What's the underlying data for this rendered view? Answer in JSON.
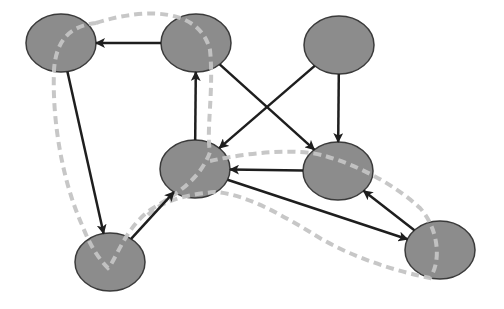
{
  "diagram": {
    "type": "directed-graph",
    "width": 504,
    "height": 309,
    "colors": {
      "background": "#ffffff",
      "node_fill": "#8c8c8c",
      "node_stroke": "#3a3a3a",
      "edge": "#1e1e1e",
      "cycle_highlight": "#c4c4c4"
    },
    "node_radius": {
      "rx": 35,
      "ry": 29
    },
    "nodes": [
      {
        "id": "n1",
        "cx": 61,
        "cy": 43
      },
      {
        "id": "n2",
        "cx": 196,
        "cy": 43
      },
      {
        "id": "n3",
        "cx": 339,
        "cy": 45
      },
      {
        "id": "n4",
        "cx": 195,
        "cy": 169
      },
      {
        "id": "n5",
        "cx": 338,
        "cy": 171
      },
      {
        "id": "n6",
        "cx": 110,
        "cy": 262
      },
      {
        "id": "n7",
        "cx": 440,
        "cy": 250
      }
    ],
    "edges": [
      {
        "from": "n2",
        "to": "n1"
      },
      {
        "from": "n1",
        "to": "n6"
      },
      {
        "from": "n6",
        "to": "n4"
      },
      {
        "from": "n4",
        "to": "n2"
      },
      {
        "from": "n2",
        "to": "n5"
      },
      {
        "from": "n3",
        "to": "n4"
      },
      {
        "from": "n3",
        "to": "n5"
      },
      {
        "from": "n5",
        "to": "n4"
      },
      {
        "from": "n4",
        "to": "n7"
      },
      {
        "from": "n7",
        "to": "n5"
      }
    ],
    "highlighted_cycles": [
      {
        "id": "cycle-left",
        "nodes": [
          "n1",
          "n6",
          "n4",
          "n2"
        ]
      },
      {
        "id": "cycle-right",
        "nodes": [
          "n4",
          "n5",
          "n7"
        ]
      }
    ]
  }
}
